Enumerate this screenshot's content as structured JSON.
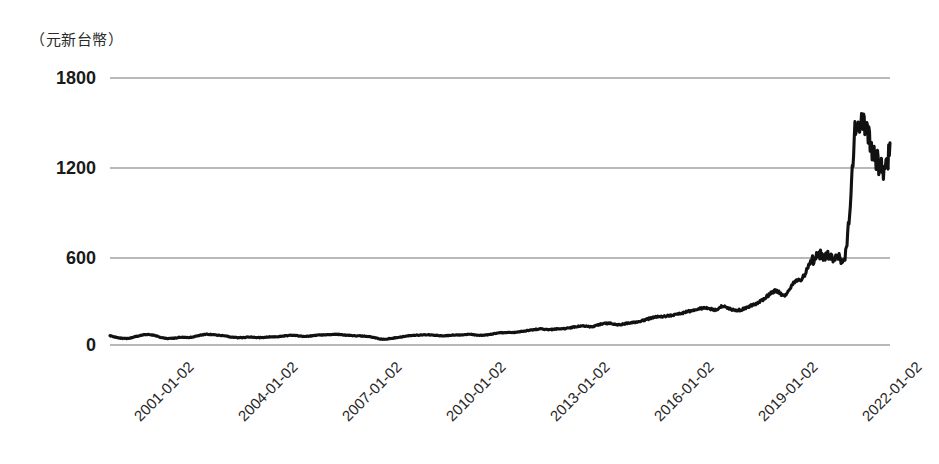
{
  "chart_data": {
    "type": "line",
    "title": "",
    "subtitle": "",
    "xlabel": "",
    "ylabel": "（元新台幣）",
    "unit_label": "（元新台幣）",
    "legend": [],
    "legend_position": "none",
    "grid": true,
    "grid_axis": "y",
    "ylim": [
      0,
      1800
    ],
    "yticks": [
      0,
      600,
      1200,
      1800
    ],
    "ytick_labels": [
      "0",
      "600",
      "1200",
      "1800"
    ],
    "xticks": [
      "2001-01-02",
      "2004-01-02",
      "2007-01-02",
      "2010-01-02",
      "2013-01-02",
      "2016-01-02",
      "2019-01-02",
      "2022-01-02"
    ],
    "xtick_labels": [
      "2001-01-02",
      "2004-01-02",
      "2007-01-02",
      "2010-01-02",
      "2013-01-02",
      "2016-01-02",
      "2019-01-02",
      "2022-01-02"
    ],
    "xlim": [
      "2001-01-02",
      "2023-04-01"
    ],
    "series": [
      {
        "name": "股價",
        "color": "#111111",
        "x": [
          "2001-01",
          "2001-04",
          "2001-07",
          "2001-10",
          "2002-01",
          "2002-04",
          "2002-07",
          "2002-10",
          "2003-01",
          "2003-04",
          "2003-07",
          "2003-10",
          "2004-01",
          "2004-04",
          "2004-07",
          "2004-10",
          "2005-01",
          "2005-04",
          "2005-07",
          "2005-10",
          "2006-01",
          "2006-04",
          "2006-07",
          "2006-10",
          "2007-01",
          "2007-04",
          "2007-07",
          "2007-10",
          "2008-01",
          "2008-04",
          "2008-07",
          "2008-10",
          "2009-01",
          "2009-04",
          "2009-07",
          "2009-10",
          "2010-01",
          "2010-04",
          "2010-07",
          "2010-10",
          "2011-01",
          "2011-04",
          "2011-07",
          "2011-10",
          "2012-01",
          "2012-04",
          "2012-07",
          "2012-10",
          "2013-01",
          "2013-04",
          "2013-07",
          "2013-10",
          "2014-01",
          "2014-04",
          "2014-07",
          "2014-10",
          "2015-01",
          "2015-04",
          "2015-07",
          "2015-10",
          "2016-01",
          "2016-04",
          "2016-07",
          "2016-10",
          "2017-01",
          "2017-04",
          "2017-07",
          "2017-10",
          "2018-01",
          "2018-04",
          "2018-07",
          "2018-10",
          "2019-01",
          "2019-04",
          "2019-07",
          "2019-10",
          "2020-01",
          "2020-04",
          "2020-07",
          "2020-10",
          "2021-01",
          "2021-04",
          "2021-07",
          "2021-10",
          "2022-01",
          "2022-04",
          "2022-07",
          "2022-10",
          "2023-01",
          "2023-04"
        ],
        "values": [
          62,
          48,
          44,
          58,
          70,
          66,
          48,
          44,
          52,
          50,
          62,
          72,
          68,
          62,
          52,
          50,
          54,
          50,
          54,
          56,
          62,
          66,
          58,
          62,
          68,
          70,
          72,
          66,
          62,
          60,
          52,
          40,
          44,
          52,
          62,
          66,
          68,
          66,
          62,
          66,
          68,
          72,
          66,
          68,
          78,
          84,
          84,
          92,
          100,
          108,
          104,
          108,
          112,
          122,
          128,
          124,
          140,
          146,
          136,
          146,
          155,
          168,
          186,
          192,
          200,
          212,
          226,
          240,
          250,
          238,
          262,
          238,
          238,
          262,
          286,
          330,
          366,
          332,
          420,
          452,
          560,
          602,
          598,
          600,
          640,
          1400,
          1480,
          1320,
          1180,
          1290
        ]
      }
    ],
    "peak_value": 1660,
    "min_value": 40,
    "last_value": 1290
  },
  "axis": {
    "y_unit_caption": "（元新台幣）"
  }
}
